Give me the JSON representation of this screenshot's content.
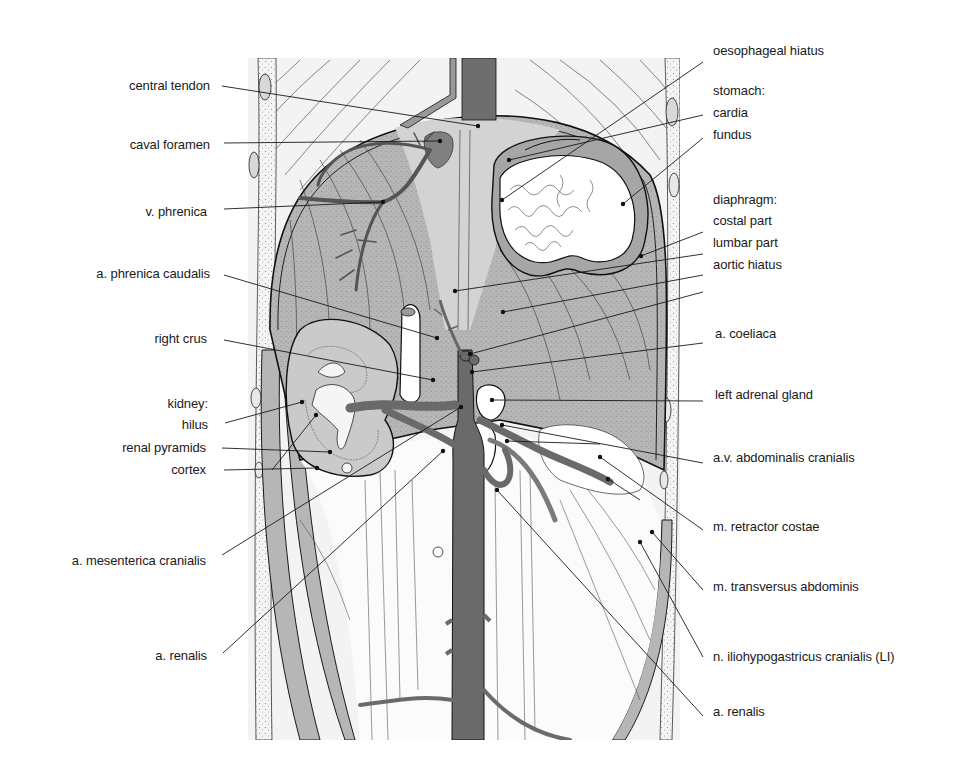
{
  "figure": {
    "type": "anatomical-illustration",
    "colors": {
      "background": "#ffffff",
      "frame": "#f2f2f2",
      "diaphragm": "#b4b4b4",
      "central_tendon": "#d6d6d6",
      "vessel_dark": "#6a6a6a",
      "vessel_mid": "#8c8c8c",
      "outline": "#1a1a1a",
      "organ_light": "#ececec"
    }
  },
  "labels_left": [
    {
      "id": "central-tendon",
      "text": "central tendon",
      "x": 210,
      "y": 86
    },
    {
      "id": "caval-foramen",
      "text": "caval foramen",
      "x": 210,
      "y": 146
    },
    {
      "id": "v-phrenica",
      "text": "v. phrenica",
      "x": 207,
      "y": 212
    },
    {
      "id": "a-phrenica-caudalis",
      "text": "a. phrenica caudalis",
      "x": 210,
      "y": 275
    },
    {
      "id": "right-crus",
      "text": "right crus",
      "x": 207,
      "y": 340
    },
    {
      "id": "kidney-heading",
      "text": "kidney:",
      "x": 208,
      "y": 404
    },
    {
      "id": "hilus",
      "text": "hilus",
      "x": 208,
      "y": 425
    },
    {
      "id": "renal-pyramids",
      "text": "renal pyramids",
      "x": 206,
      "y": 448
    },
    {
      "id": "cortex",
      "text": "cortex",
      "x": 206,
      "y": 470
    },
    {
      "id": "a-mesenterica-cranialis",
      "text": "a. mesenterica cranialis",
      "x": 206,
      "y": 562
    },
    {
      "id": "a-renalis-left",
      "text": "a. renalis",
      "x": 207,
      "y": 656
    }
  ],
  "labels_right": [
    {
      "id": "oesophageal-hiatus",
      "text": "oesophageal hiatus",
      "x": 713,
      "y": 51
    },
    {
      "id": "stomach-heading",
      "text": "stomach:",
      "x": 713,
      "y": 91
    },
    {
      "id": "cardia",
      "text": "cardia",
      "x": 713,
      "y": 113
    },
    {
      "id": "fundus",
      "text": "fundus",
      "x": 713,
      "y": 134
    },
    {
      "id": "diaphragm-heading",
      "text": "diaphragm:",
      "x": 713,
      "y": 200
    },
    {
      "id": "costal-part",
      "text": "costal part",
      "x": 713,
      "y": 221
    },
    {
      "id": "lumbar-part",
      "text": "lumbar part",
      "x": 713,
      "y": 242
    },
    {
      "id": "aortic-hiatus",
      "text": "aortic hiatus",
      "x": 713,
      "y": 264
    },
    {
      "id": "a-coeliaca",
      "text": "a. coeliaca",
      "x": 715,
      "y": 334
    },
    {
      "id": "left-adrenal-gland",
      "text": "left adrenal gland",
      "x": 715,
      "y": 395
    },
    {
      "id": "av-abdominalis-cranialis",
      "text": "a.v. abdominalis cranialis",
      "x": 713,
      "y": 458
    },
    {
      "id": "m-retractor-costae",
      "text": "m. retractor costae",
      "x": 713,
      "y": 527
    },
    {
      "id": "m-transversus-abdominis",
      "text": "m. transversus abdominis",
      "x": 713,
      "y": 587
    },
    {
      "id": "n-iliohypogastricus-cranialis",
      "text": "n. iliohypogastricus cranialis (LI)",
      "x": 713,
      "y": 657
    },
    {
      "id": "a-renalis-right",
      "text": "a. renalis",
      "x": 713,
      "y": 712
    }
  ],
  "leader_lines": [
    {
      "for": "central-tendon",
      "x1": 222,
      "y1": 86,
      "x2": 478,
      "y2": 126
    },
    {
      "for": "caval-foramen",
      "x1": 224,
      "y1": 143,
      "x2": 440,
      "y2": 141
    },
    {
      "for": "v-phrenica",
      "x1": 224,
      "y1": 209,
      "x2": 383,
      "y2": 202
    },
    {
      "for": "a-phrenica-caudalis",
      "x1": 224,
      "y1": 275,
      "x2": 437,
      "y2": 338
    },
    {
      "for": "right-crus",
      "x1": 224,
      "y1": 340,
      "x2": 433,
      "y2": 380
    },
    {
      "for": "hilus",
      "x1": 225,
      "y1": 423,
      "x2": 302,
      "y2": 402
    },
    {
      "for": "renal-pyramids",
      "x1": 222,
      "y1": 448,
      "x2": 330,
      "y2": 452
    },
    {
      "for": "cortex",
      "x1": 224,
      "y1": 470,
      "x2": 317,
      "y2": 468
    },
    {
      "for": "kidney-cortex-line",
      "x1": 272,
      "y1": 470,
      "x2": 316,
      "y2": 415
    },
    {
      "for": "a-mesenterica-cranialis",
      "x1": 222,
      "y1": 555,
      "x2": 461,
      "y2": 407
    },
    {
      "for": "a-renalis-left",
      "x1": 223,
      "y1": 653,
      "x2": 443,
      "y2": 451
    },
    {
      "for": "oesophageal-hiatus",
      "x1": 703,
      "y1": 62,
      "x2": 502,
      "y2": 200
    },
    {
      "for": "cardia",
      "x1": 703,
      "y1": 115,
      "x2": 509,
      "y2": 160
    },
    {
      "for": "fundus",
      "x1": 703,
      "y1": 138,
      "x2": 623,
      "y2": 204
    },
    {
      "for": "costal-part",
      "x1": 703,
      "y1": 232,
      "x2": 641,
      "y2": 256
    },
    {
      "for": "lumbar-part",
      "x1": 703,
      "y1": 254,
      "x2": 455,
      "y2": 291
    },
    {
      "for": "aortic-hiatus",
      "x1": 703,
      "y1": 275,
      "x2": 503,
      "y2": 312
    },
    {
      "for": "a-coeliaca",
      "x1": 703,
      "y1": 343,
      "x2": 472,
      "y2": 372
    },
    {
      "for": "a-coeliaca-2",
      "x1": 703,
      "y1": 292,
      "x2": 470,
      "y2": 354
    },
    {
      "for": "left-adrenal-gland",
      "x1": 703,
      "y1": 401,
      "x2": 492,
      "y2": 400
    },
    {
      "for": "av-abdominalis-cranialis",
      "x1": 703,
      "y1": 463,
      "x2": 502,
      "y2": 425
    },
    {
      "for": "av-abdominalis-cranialis-2",
      "x1": 600,
      "y1": 444,
      "x2": 507,
      "y2": 441
    },
    {
      "for": "m-retractor-costae",
      "x1": 703,
      "y1": 530,
      "x2": 600,
      "y2": 457
    },
    {
      "for": "m-retractor-costae-2",
      "x1": 640,
      "y1": 500,
      "x2": 608,
      "y2": 479
    },
    {
      "for": "m-transversus-abdominis",
      "x1": 703,
      "y1": 590,
      "x2": 652,
      "y2": 532
    },
    {
      "for": "n-iliohypogastricus-cranialis",
      "x1": 703,
      "y1": 657,
      "x2": 640,
      "y2": 542
    },
    {
      "for": "a-renalis-right",
      "x1": 703,
      "y1": 716,
      "x2": 497,
      "y2": 490
    }
  ]
}
